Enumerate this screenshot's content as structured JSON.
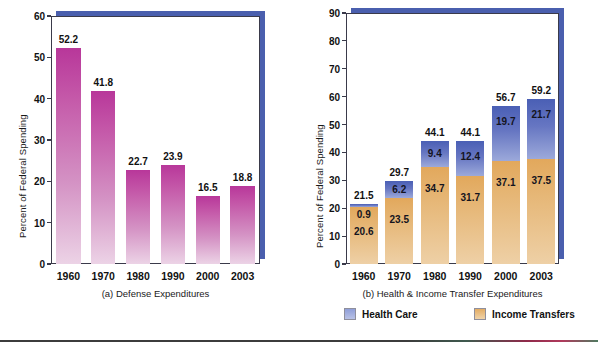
{
  "chart_data": [
    {
      "type": "bar",
      "panel_id": "a",
      "title": "",
      "caption": "(a) Defense Expenditures",
      "xlabel": "",
      "ylabel": "Percent of Federal Spending",
      "categories": [
        "1960",
        "1970",
        "1980",
        "1990",
        "2000",
        "2003"
      ],
      "values": [
        52.2,
        41.8,
        22.7,
        23.9,
        16.5,
        18.8
      ],
      "value_labels": [
        "52.2",
        "41.8",
        "22.7",
        "23.9",
        "16.5",
        "18.8"
      ],
      "ylim": [
        0,
        60
      ],
      "yticks": [
        0,
        10,
        20,
        30,
        40,
        50,
        60
      ],
      "ytick_labels": [
        "0",
        "10",
        "20",
        "30",
        "40",
        "50",
        "60"
      ],
      "grid": false,
      "legend": false,
      "bar_color_top": "#b8379a",
      "bar_color_bottom": "#ecd3e6"
    },
    {
      "type": "bar",
      "panel_id": "b",
      "stacked": true,
      "title": "",
      "caption": "(b) Health & Income Transfer Expenditures",
      "xlabel": "",
      "ylabel": "Percent of Federal Spending",
      "categories": [
        "1960",
        "1970",
        "1980",
        "1990",
        "2000",
        "2003"
      ],
      "series": [
        {
          "name": "Income Transfers",
          "values": [
            20.6,
            23.5,
            34.7,
            31.7,
            37.1,
            37.5
          ],
          "value_labels": [
            "20.6",
            "23.5",
            "34.7",
            "31.7",
            "37.1",
            "37.5"
          ],
          "color_top": "#e2a85c",
          "color_bottom": "#eed0a6"
        },
        {
          "name": "Health Care",
          "values": [
            0.9,
            6.2,
            9.4,
            12.4,
            19.7,
            21.7
          ],
          "value_labels": [
            "0.9",
            "6.2",
            "9.4",
            "12.4",
            "19.7",
            "21.7"
          ],
          "color_top": "#4a5fb5",
          "color_bottom": "#9ca9da"
        }
      ],
      "totals": [
        21.5,
        29.7,
        44.1,
        44.1,
        56.7,
        59.2
      ],
      "total_labels": [
        "21.5",
        "29.7",
        "44.1",
        "44.1",
        "56.7",
        "59.2"
      ],
      "ylim": [
        0,
        90
      ],
      "yticks": [
        0,
        10,
        20,
        30,
        40,
        50,
        60,
        70,
        80,
        90
      ],
      "ytick_labels": [
        "0",
        "10",
        "20",
        "30",
        "40",
        "50",
        "60",
        "70",
        "80",
        "90"
      ],
      "grid": false,
      "legend": true,
      "legend_position": "below",
      "legend_entries": [
        {
          "label": "Health Care",
          "swatch": "health"
        },
        {
          "label": "Income Transfers",
          "swatch": "income"
        }
      ]
    }
  ],
  "panel_a": {
    "ylabel": "Percent of Federal Spending",
    "caption": "(a) Defense Expenditures",
    "yticks": [
      "60",
      "50",
      "40",
      "30",
      "20",
      "10",
      "0"
    ],
    "xticks": [
      "1960",
      "1970",
      "1980",
      "1990",
      "2000",
      "2003"
    ],
    "values": [
      "52.2",
      "41.8",
      "22.7",
      "23.9",
      "16.5",
      "18.8"
    ]
  },
  "panel_b": {
    "ylabel": "Percent of Federal Spending",
    "caption": "(b) Health & Income Transfer Expenditures",
    "yticks": [
      "90",
      "80",
      "70",
      "60",
      "50",
      "40",
      "30",
      "20",
      "10",
      "0"
    ],
    "xticks": [
      "1960",
      "1970",
      "1980",
      "1990",
      "2000",
      "2003"
    ],
    "totals": [
      "21.5",
      "29.7",
      "44.1",
      "44.1",
      "56.7",
      "59.2"
    ],
    "health": [
      "0.9",
      "6.2",
      "9.4",
      "12.4",
      "19.7",
      "21.7"
    ],
    "income": [
      "20.6",
      "23.5",
      "34.7",
      "31.7",
      "37.1",
      "37.5"
    ],
    "legend": {
      "health_label": "Health Care",
      "income_label": "Income Transfers"
    }
  },
  "colors": {
    "defense_bar_top": "#b8379a",
    "defense_bar_bottom": "#ecd3e6",
    "health_top": "#4a5fb5",
    "health_bottom": "#9ca9da",
    "income_top": "#e2a85c",
    "income_bottom": "#eed0a6",
    "frame_shadow": "#4a5fae",
    "frame_border": "#3a3a4a"
  }
}
